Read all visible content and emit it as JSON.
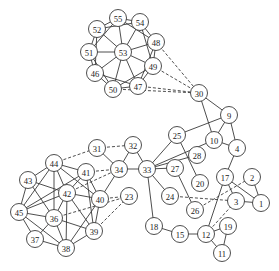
{
  "diagram": {
    "type": "undirected-graph",
    "node_radius": 8.5,
    "nodes": [
      {
        "id": "1",
        "x": 261,
        "y": 203
      },
      {
        "id": "2",
        "x": 252,
        "y": 177
      },
      {
        "id": "3",
        "x": 236,
        "y": 201
      },
      {
        "id": "4",
        "x": 237,
        "y": 148
      },
      {
        "id": "9",
        "x": 229,
        "y": 115
      },
      {
        "id": "10",
        "x": 214,
        "y": 140
      },
      {
        "id": "11",
        "x": 222,
        "y": 253
      },
      {
        "id": "12",
        "x": 206,
        "y": 234
      },
      {
        "id": "15",
        "x": 180,
        "y": 234
      },
      {
        "id": "17",
        "x": 225,
        "y": 177
      },
      {
        "id": "18",
        "x": 154,
        "y": 226
      },
      {
        "id": "19",
        "x": 228,
        "y": 226
      },
      {
        "id": "20",
        "x": 200,
        "y": 183
      },
      {
        "id": "23",
        "x": 129,
        "y": 196
      },
      {
        "id": "24",
        "x": 170,
        "y": 196
      },
      {
        "id": "25",
        "x": 177,
        "y": 135
      },
      {
        "id": "26",
        "x": 195,
        "y": 210
      },
      {
        "id": "27",
        "x": 175,
        "y": 168
      },
      {
        "id": "28",
        "x": 197,
        "y": 155
      },
      {
        "id": "30",
        "x": 199,
        "y": 93
      },
      {
        "id": "31",
        "x": 97,
        "y": 148
      },
      {
        "id": "32",
        "x": 133,
        "y": 145
      },
      {
        "id": "33",
        "x": 147,
        "y": 169
      },
      {
        "id": "34",
        "x": 119,
        "y": 169
      },
      {
        "id": "36",
        "x": 54,
        "y": 218
      },
      {
        "id": "37",
        "x": 35,
        "y": 239
      },
      {
        "id": "38",
        "x": 66,
        "y": 248
      },
      {
        "id": "39",
        "x": 94,
        "y": 231
      },
      {
        "id": "40",
        "x": 100,
        "y": 199
      },
      {
        "id": "41",
        "x": 86,
        "y": 172
      },
      {
        "id": "42",
        "x": 67,
        "y": 193
      },
      {
        "id": "43",
        "x": 28,
        "y": 180
      },
      {
        "id": "44",
        "x": 54,
        "y": 163
      },
      {
        "id": "45",
        "x": 19,
        "y": 212
      },
      {
        "id": "46",
        "x": 95,
        "y": 73
      },
      {
        "id": "47",
        "x": 138,
        "y": 86
      },
      {
        "id": "48",
        "x": 156,
        "y": 42
      },
      {
        "id": "49",
        "x": 153,
        "y": 66
      },
      {
        "id": "50",
        "x": 113,
        "y": 89
      },
      {
        "id": "51",
        "x": 89,
        "y": 52
      },
      {
        "id": "52",
        "x": 97,
        "y": 29
      },
      {
        "id": "53",
        "x": 123,
        "y": 52
      },
      {
        "id": "54",
        "x": 140,
        "y": 22
      },
      {
        "id": "55",
        "x": 118,
        "y": 18
      }
    ],
    "edges": [
      [
        "55",
        "54",
        "solid"
      ],
      [
        "54",
        "48",
        "solid"
      ],
      [
        "48",
        "49",
        "solid"
      ],
      [
        "49",
        "47",
        "solid"
      ],
      [
        "47",
        "50",
        "solid"
      ],
      [
        "50",
        "46",
        "solid"
      ],
      [
        "46",
        "51",
        "solid"
      ],
      [
        "51",
        "52",
        "solid"
      ],
      [
        "52",
        "55",
        "solid"
      ],
      [
        "53",
        "55",
        "solid"
      ],
      [
        "53",
        "54",
        "solid"
      ],
      [
        "53",
        "48",
        "solid"
      ],
      [
        "53",
        "49",
        "solid"
      ],
      [
        "53",
        "47",
        "solid"
      ],
      [
        "53",
        "50",
        "solid"
      ],
      [
        "53",
        "46",
        "solid"
      ],
      [
        "53",
        "51",
        "solid"
      ],
      [
        "53",
        "52",
        "solid"
      ],
      [
        "52",
        "54",
        "solid"
      ],
      [
        "54",
        "49",
        "solid"
      ],
      [
        "48",
        "47",
        "solid"
      ],
      [
        "49",
        "50",
        "solid"
      ],
      [
        "47",
        "46",
        "solid"
      ],
      [
        "50",
        "51",
        "solid"
      ],
      [
        "46",
        "52",
        "solid"
      ],
      [
        "51",
        "55",
        "solid"
      ],
      [
        "55",
        "48",
        "solid"
      ],
      [
        "48",
        "30",
        "dashed"
      ],
      [
        "49",
        "30",
        "dashed"
      ],
      [
        "47",
        "30",
        "dashed"
      ],
      [
        "50",
        "30",
        "dashed"
      ],
      [
        "30",
        "9",
        "solid"
      ],
      [
        "30",
        "10",
        "solid"
      ],
      [
        "9",
        "10",
        "solid"
      ],
      [
        "9",
        "4",
        "solid"
      ],
      [
        "9",
        "25",
        "solid"
      ],
      [
        "10",
        "4",
        "solid"
      ],
      [
        "4",
        "17",
        "solid"
      ],
      [
        "33",
        "25",
        "solid"
      ],
      [
        "33",
        "10",
        "solid"
      ],
      [
        "33",
        "28",
        "solid"
      ],
      [
        "33",
        "27",
        "solid"
      ],
      [
        "33",
        "24",
        "solid"
      ],
      [
        "33",
        "18",
        "solid"
      ],
      [
        "33",
        "34",
        "solid"
      ],
      [
        "33",
        "32",
        "solid"
      ],
      [
        "25",
        "20",
        "solid"
      ],
      [
        "27",
        "26",
        "solid"
      ],
      [
        "24",
        "3",
        "dashed"
      ],
      [
        "26",
        "2",
        "dashed"
      ],
      [
        "17",
        "3",
        "solid"
      ],
      [
        "17",
        "1",
        "solid"
      ],
      [
        "17",
        "12",
        "solid"
      ],
      [
        "2",
        "1",
        "solid"
      ],
      [
        "3",
        "1",
        "solid"
      ],
      [
        "12",
        "3",
        "dashed"
      ],
      [
        "12",
        "19",
        "solid"
      ],
      [
        "12",
        "11",
        "solid"
      ],
      [
        "19",
        "11",
        "solid"
      ],
      [
        "18",
        "15",
        "solid"
      ],
      [
        "15",
        "12",
        "solid"
      ],
      [
        "31",
        "32",
        "dashed"
      ],
      [
        "31",
        "34",
        "solid"
      ],
      [
        "32",
        "34",
        "solid"
      ],
      [
        "34",
        "40",
        "solid"
      ],
      [
        "44",
        "31",
        "dashed"
      ],
      [
        "41",
        "34",
        "dashed"
      ],
      [
        "42",
        "34",
        "dashed"
      ],
      [
        "40",
        "23",
        "dashed"
      ],
      [
        "36",
        "23",
        "dashed"
      ],
      [
        "39",
        "23",
        "dashed"
      ],
      [
        "44",
        "43",
        "solid"
      ],
      [
        "44",
        "41",
        "solid"
      ],
      [
        "44",
        "42",
        "solid"
      ],
      [
        "44",
        "36",
        "solid"
      ],
      [
        "44",
        "45",
        "solid"
      ],
      [
        "44",
        "40",
        "solid"
      ],
      [
        "43",
        "45",
        "solid"
      ],
      [
        "43",
        "42",
        "solid"
      ],
      [
        "43",
        "36",
        "solid"
      ],
      [
        "45",
        "42",
        "solid"
      ],
      [
        "45",
        "36",
        "solid"
      ],
      [
        "45",
        "37",
        "solid"
      ],
      [
        "45",
        "38",
        "solid"
      ],
      [
        "41",
        "42",
        "solid"
      ],
      [
        "41",
        "40",
        "solid"
      ],
      [
        "41",
        "39",
        "solid"
      ],
      [
        "41",
        "45",
        "solid"
      ],
      [
        "42",
        "40",
        "solid"
      ],
      [
        "42",
        "36",
        "solid"
      ],
      [
        "42",
        "38",
        "solid"
      ],
      [
        "42",
        "39",
        "solid"
      ],
      [
        "40",
        "39",
        "solid"
      ],
      [
        "40",
        "38",
        "solid"
      ],
      [
        "36",
        "38",
        "solid"
      ],
      [
        "36",
        "39",
        "solid"
      ],
      [
        "36",
        "37",
        "solid"
      ],
      [
        "37",
        "38",
        "solid"
      ],
      [
        "38",
        "39",
        "solid"
      ]
    ]
  }
}
